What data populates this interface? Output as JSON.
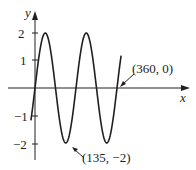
{
  "chart_data": {
    "type": "line",
    "title": "",
    "xlabel": "x",
    "ylabel": "y",
    "function": "y = 2 sin(2x)",
    "ylim": [
      -2,
      2
    ],
    "yticks": [
      {
        "value": 2,
        "label": "2"
      },
      {
        "value": 1,
        "label": "1"
      },
      {
        "value": -1,
        "label": "−1"
      },
      {
        "value": -2,
        "label": "−2"
      }
    ],
    "annotations": [
      {
        "point": [
          360,
          0
        ],
        "label": "(360, 0)"
      },
      {
        "point": [
          135,
          -2
        ],
        "label": "(135, −2)"
      }
    ],
    "series": [
      {
        "name": "curve",
        "x": [
          0,
          45,
          90,
          135,
          180,
          225,
          270,
          315,
          360
        ],
        "values": [
          0,
          2,
          0,
          -2,
          0,
          2,
          0,
          -2,
          0
        ]
      }
    ]
  },
  "labels": {
    "x_axis": "x",
    "y_axis": "y",
    "tick_2": "2",
    "tick_1": "1",
    "tick_m1": "−1",
    "tick_m2": "−2",
    "annot_360": "(360, 0)",
    "annot_135": "(135, −2)"
  }
}
